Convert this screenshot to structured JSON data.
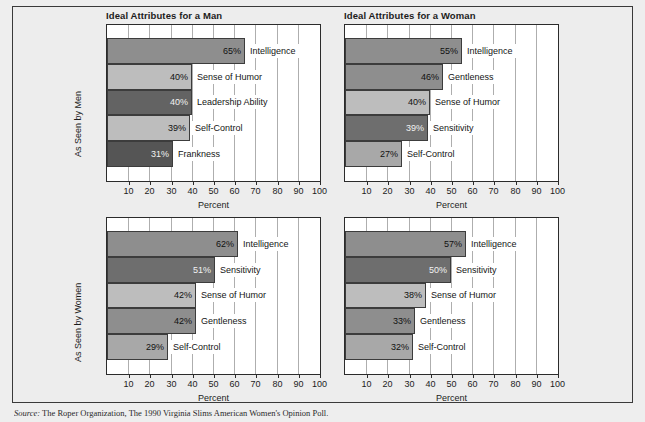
{
  "figure": {
    "background_color": "#eeeeee",
    "frame_color": "#3a3a3a",
    "plot_background": "#ffffff",
    "grid_color": "#aeaeae",
    "xtitle": "Percent",
    "source_label": "Source:",
    "source_text": "The Roper Organization, The 1990 Virginia Slims American Women's Opinion Poll."
  },
  "colors": {
    "bar_medium": "#8e8e8e",
    "bar_light": "#bdbdbd",
    "bar_dark": "#636363",
    "bar_border": "#3c3c3c"
  },
  "axis": {
    "ticks": [
      10,
      20,
      30,
      40,
      50,
      60,
      70,
      80,
      90,
      100
    ],
    "tick_labels": [
      "10",
      "20",
      "30",
      "40",
      "50",
      "60",
      "70",
      "80",
      "90",
      "100"
    ],
    "min": 0,
    "max": 100
  },
  "row_labels": {
    "top": "As Seen by Men",
    "bottom": "As Seen by Women"
  },
  "chart_data": [
    {
      "id": "men-ideal-man",
      "type": "bar",
      "orientation": "horizontal",
      "title": "Ideal Attributes for a Man",
      "row_label": "As Seen by Men",
      "xlabel": "Percent",
      "ylabel": "",
      "xlim": [
        0,
        100
      ],
      "grid": true,
      "categories": [
        "Intelligence",
        "Sense of Humor",
        "Leadership Ability",
        "Self-Control",
        "Frankness"
      ],
      "values": [
        65,
        40,
        40,
        39,
        31
      ],
      "value_labels": [
        "65%",
        "40%",
        "40%",
        "39%",
        "31%"
      ],
      "bar_colors": [
        "#8e8e8e",
        "#bdbdbd",
        "#636363",
        "#bdbdbd",
        "#555555"
      ]
    },
    {
      "id": "men-ideal-woman",
      "type": "bar",
      "orientation": "horizontal",
      "title": "Ideal Attributes for a Woman",
      "row_label": "As Seen by Men",
      "xlabel": "Percent",
      "ylabel": "",
      "xlim": [
        0,
        100
      ],
      "grid": true,
      "categories": [
        "Intelligence",
        "Gentleness",
        "Sense of Humor",
        "Sensitivity",
        "Self-Control"
      ],
      "values": [
        55,
        46,
        40,
        39,
        27
      ],
      "value_labels": [
        "55%",
        "46%",
        "40%",
        "39%",
        "27%"
      ],
      "bar_colors": [
        "#8e8e8e",
        "#8e8e8e",
        "#bdbdbd",
        "#6e6e6e",
        "#a8a8a8"
      ]
    },
    {
      "id": "women-ideal-man",
      "type": "bar",
      "orientation": "horizontal",
      "title": "",
      "row_label": "As Seen by Women",
      "xlabel": "Percent",
      "ylabel": "",
      "xlim": [
        0,
        100
      ],
      "grid": true,
      "categories": [
        "Intelligence",
        "Sensitivity",
        "Sense of Humor",
        "Gentleness",
        "Self-Control"
      ],
      "values": [
        62,
        51,
        42,
        42,
        29
      ],
      "value_labels": [
        "62%",
        "51%",
        "42%",
        "42%",
        "29%"
      ],
      "bar_colors": [
        "#8e8e8e",
        "#6e6e6e",
        "#bdbdbd",
        "#8e8e8e",
        "#a8a8a8"
      ]
    },
    {
      "id": "women-ideal-woman",
      "type": "bar",
      "orientation": "horizontal",
      "title": "",
      "row_label": "As Seen by Women",
      "xlabel": "Percent",
      "ylabel": "",
      "xlim": [
        0,
        100
      ],
      "grid": true,
      "categories": [
        "Intelligence",
        "Sensitivity",
        "Sense of Humor",
        "Gentleness",
        "Self-Control"
      ],
      "values": [
        57,
        50,
        38,
        33,
        32
      ],
      "value_labels": [
        "57%",
        "50%",
        "38%",
        "33%",
        "32%"
      ],
      "bar_colors": [
        "#8e8e8e",
        "#6e6e6e",
        "#bdbdbd",
        "#8e8e8e",
        "#a8a8a8"
      ]
    }
  ]
}
